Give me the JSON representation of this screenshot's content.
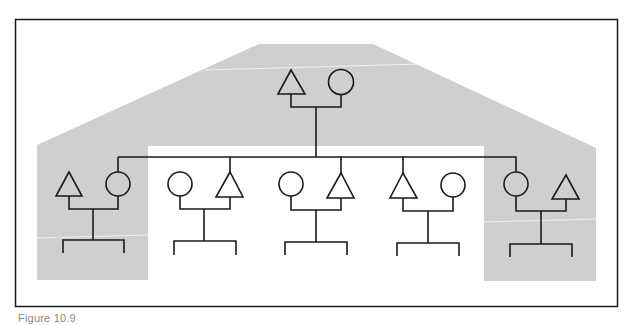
{
  "figure": {
    "caption": "Figure 10.9",
    "type": "kinship-diagram",
    "colors": {
      "shade": "#cfcfcf",
      "line": "#1a1a1a",
      "frame": "#1a1a1a",
      "background": "#ffffff"
    },
    "legend_symbols": {
      "triangle": "male",
      "circle": "female"
    },
    "generations": [
      {
        "level": 1,
        "couples": [
          {
            "id": "parents",
            "left": "triangle",
            "right": "circle",
            "shaded": true
          }
        ]
      },
      {
        "level": 2,
        "couples": [
          {
            "id": "sibling-1",
            "left": "triangle",
            "right": "circle",
            "descent_from": "circle",
            "shaded": true
          },
          {
            "id": "sibling-2",
            "left": "circle",
            "right": "triangle",
            "descent_from": "triangle",
            "shaded": false
          },
          {
            "id": "sibling-3",
            "left": "circle",
            "right": "triangle",
            "descent_from": "triangle",
            "shaded": false
          },
          {
            "id": "sibling-4",
            "left": "triangle",
            "right": "circle",
            "descent_from": "triangle",
            "shaded": false
          },
          {
            "id": "sibling-5",
            "left": "circle",
            "right": "triangle",
            "descent_from": "circle",
            "shaded": true
          }
        ]
      }
    ]
  }
}
